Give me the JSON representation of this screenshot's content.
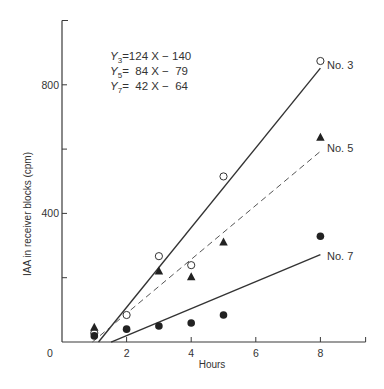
{
  "chart_data": {
    "type": "scatter",
    "title": "",
    "xlabel": "Hours",
    "ylabel": "IAA in receiver blocks (cpm)",
    "xlim": [
      0,
      9.4
    ],
    "ylim": [
      0,
      1000
    ],
    "x_ticks": [
      0,
      2,
      4,
      6,
      8
    ],
    "x_tick_labels": [
      "0",
      "2",
      "4",
      "6",
      "8"
    ],
    "y_ticks": [
      200,
      400,
      600,
      800,
      1000
    ],
    "y_tick_labels": [
      "",
      "400",
      "",
      "800",
      ""
    ],
    "origin_label": "0",
    "grid": false,
    "equations": [
      {
        "lhs": "Y",
        "sub": "3",
        "rhs": "=124 X − 140"
      },
      {
        "lhs": "Y",
        "sub": "5",
        "rhs": "=  84 X −  79"
      },
      {
        "lhs": "Y",
        "sub": "7",
        "rhs": "=  42 X −  64"
      }
    ],
    "series": [
      {
        "name": "No. 3",
        "marker": "open-circle",
        "line_style": "solid",
        "fit": {
          "slope": 124,
          "intercept": -140,
          "x_range": [
            1.13,
            8
          ]
        },
        "points": [
          [
            1,
            28
          ],
          [
            2,
            84
          ],
          [
            3,
            267
          ],
          [
            4,
            239
          ],
          [
            5,
            515
          ],
          [
            8,
            874
          ]
        ]
      },
      {
        "name": "No. 5",
        "marker": "filled-triangle",
        "line_style": "dashed",
        "fit": {
          "slope": 84,
          "intercept": -79,
          "x_range": [
            0.94,
            8
          ]
        },
        "points": [
          [
            1,
            45
          ],
          [
            3,
            220
          ],
          [
            4,
            202
          ],
          [
            5,
            310
          ],
          [
            8,
            636
          ]
        ]
      },
      {
        "name": "No. 7",
        "marker": "filled-circle",
        "line_style": "solid",
        "fit": {
          "slope": 42,
          "intercept": -64,
          "x_range": [
            1.52,
            8
          ]
        },
        "points": [
          [
            1,
            19
          ],
          [
            2,
            40
          ],
          [
            3,
            50
          ],
          [
            4,
            59
          ],
          [
            5,
            84
          ],
          [
            8,
            329
          ]
        ]
      }
    ]
  }
}
